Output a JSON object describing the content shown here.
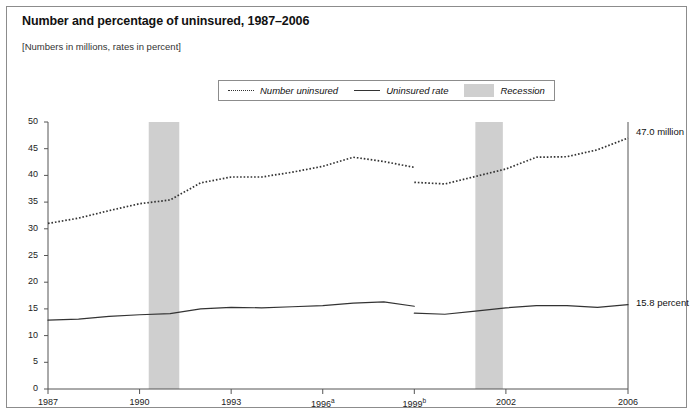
{
  "figure": {
    "title": "Number and percentage of uninsured, 1987–2006",
    "subtitle": "[Numbers in millions, rates in percent]"
  },
  "legend": {
    "items": [
      {
        "label": "Number uninsured",
        "marker": "dotted-line-swatch"
      },
      {
        "label": "Uninsured rate",
        "marker": "solid-line-swatch"
      },
      {
        "label": "Recession",
        "marker": "gray-box-swatch"
      }
    ]
  },
  "annotations": [
    {
      "name": "number-uninsured-endpoint",
      "text": "47.0 million",
      "value": 47.0
    },
    {
      "name": "uninsured-rate-endpoint",
      "text": "15.8 percent",
      "value": 15.8
    }
  ],
  "axes": {
    "y_ticks": [
      "50",
      "45",
      "40",
      "35",
      "30",
      "25",
      "20",
      "15",
      "10",
      "5",
      "0"
    ],
    "x_ticks": [
      {
        "label": "1987",
        "sup": ""
      },
      {
        "label": "1990",
        "sup": ""
      },
      {
        "label": "1993",
        "sup": ""
      },
      {
        "label": "1996",
        "sup": "a"
      },
      {
        "label": "1999",
        "sup": "b"
      },
      {
        "label": "2002",
        "sup": ""
      },
      {
        "label": "2006",
        "sup": ""
      }
    ]
  },
  "colors": {
    "frame": "#8c8c8c",
    "axis": "#555555",
    "series_line": "#333333",
    "recession_band": "#cfcfcf",
    "text": "#111111"
  },
  "chart_data": {
    "type": "line",
    "title": "Number and percentage of uninsured, 1987–2006",
    "subtitle": "[Numbers in millions, rates in percent]",
    "xlabel": "",
    "ylabel": "",
    "xlim": [
      1987,
      2006
    ],
    "ylim": [
      0,
      50
    ],
    "ytick_step": 5,
    "grid": false,
    "legend_position": "top-center",
    "x": [
      1987,
      1988,
      1989,
      1990,
      1991,
      1992,
      1993,
      1994,
      1995,
      1996,
      1997,
      1998,
      1999,
      1999,
      2000,
      2001,
      2002,
      2003,
      2004,
      2005,
      2006
    ],
    "series": [
      {
        "name": "Number uninsured",
        "style": "dotted",
        "units": "millions",
        "break_at": 1999,
        "values": [
          31.0,
          32.0,
          33.4,
          34.7,
          35.4,
          38.6,
          39.7,
          39.7,
          40.6,
          41.7,
          43.4,
          42.6,
          41.5,
          38.7,
          38.4,
          39.8,
          41.2,
          43.4,
          43.5,
          44.8,
          47.0
        ]
      },
      {
        "name": "Uninsured rate",
        "style": "solid",
        "units": "percent",
        "break_at": 1999,
        "values": [
          12.9,
          13.1,
          13.6,
          13.9,
          14.1,
          15.0,
          15.3,
          15.2,
          15.4,
          15.6,
          16.1,
          16.3,
          15.5,
          14.2,
          14.0,
          14.6,
          15.2,
          15.6,
          15.6,
          15.3,
          15.8
        ]
      }
    ],
    "recessions": [
      {
        "label": "Recession",
        "start": 1990.3,
        "end": 1991.3
      },
      {
        "label": "Recession",
        "start": 2001.0,
        "end": 2001.9
      }
    ],
    "annotations": [
      {
        "text": "47.0 million",
        "x": 2006,
        "y": 47.0
      },
      {
        "text": "15.8 percent",
        "x": 2006,
        "y": 15.8
      }
    ],
    "footnote_markers": {
      "1996": "a",
      "1999": "b"
    }
  }
}
